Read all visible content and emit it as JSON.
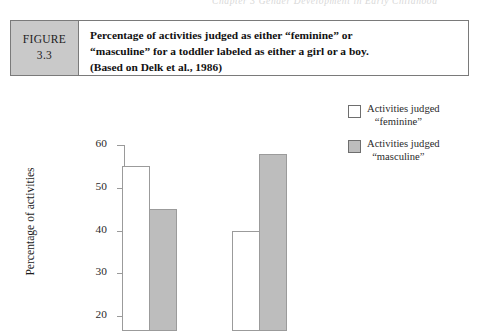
{
  "running_head": "Chapter 3  Gender Development in Early Childhood",
  "figure": {
    "tag_word": "FIGURE",
    "tag_number": "3.3",
    "caption_lines": [
      "Percentage of activities judged as either “feminine” or",
      "“masculine” for a toddler labeled as either a girl or a boy.",
      "(Based on Delk et al., 1986)"
    ]
  },
  "legend": {
    "items": [
      {
        "swatch": "white-swatch",
        "line1": "Activities judged",
        "line2": "“feminine”",
        "color": "#ffffff"
      },
      {
        "swatch": "gray-swatch",
        "line1": "Activities judged",
        "line2": "“masculine”",
        "color": "#bdbdbd"
      }
    ]
  },
  "chart_data": {
    "type": "bar",
    "title": "Percentage of activities judged as either “feminine” or “masculine” for a toddler labeled as either a girl or a boy.",
    "xlabel": "",
    "ylabel": "Percentage of activities",
    "ylim": [
      20,
      60
    ],
    "yticks": [
      20,
      30,
      40,
      50,
      60
    ],
    "ytick_labels": [
      "20",
      "30",
      "40",
      "50",
      "60"
    ],
    "grid": false,
    "legend_position": "top-right",
    "categories": [
      "Toddler labeled a girl",
      "Toddler labeled a boy"
    ],
    "series": [
      {
        "name": "Activities judged “feminine”",
        "color": "#ffffff",
        "values": [
          55,
          40
        ]
      },
      {
        "name": "Activities judged “masculine”",
        "color": "#bdbdbd",
        "values": [
          45,
          58
        ]
      }
    ],
    "note": "Image is cropped below y = 20; category axis labels are not visible."
  },
  "colors": {
    "feminine_bar": "#ffffff",
    "masculine_bar": "#bdbdbd",
    "figure_tag_bg": "#c9c9c9",
    "caption_border": "#7a7a7a",
    "axis": "#9a9a9a"
  }
}
